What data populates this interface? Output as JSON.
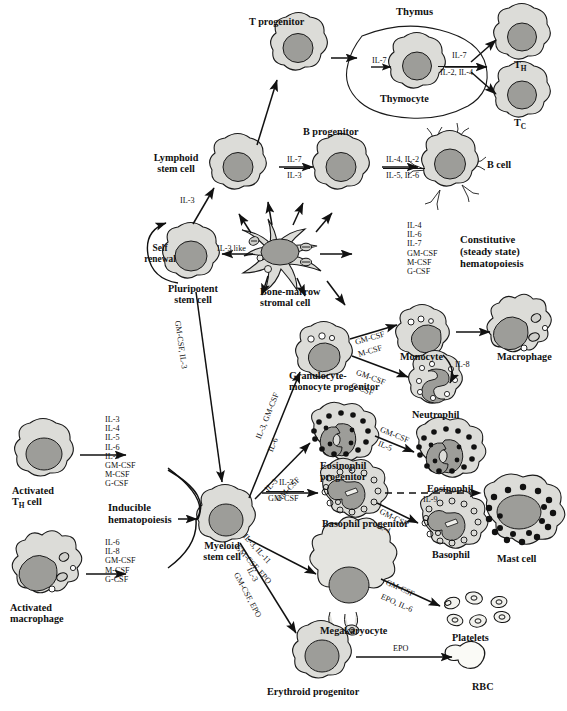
{
  "diagram": {
    "colors": {
      "cytoplasm": "#dcdcd8",
      "nucleus": "#9d9d99",
      "outline": "#1a1a1a",
      "granule": "#111111",
      "background": "#ffffff"
    }
  },
  "cells": {
    "t_progenitor": "T progenitor",
    "thymus": "Thymus",
    "thymocyte": "Thymocyte",
    "th": "T",
    "th_sub": "H",
    "tc": "T",
    "tc_sub": "C",
    "lymphoid_stem": "Lymphoid\nstem cell",
    "b_progenitor": "B progenitor",
    "b_cell": "B cell",
    "self_renewal": "Self\nrenewal",
    "pluripotent": "Pluripotent\nstem cell",
    "stromal": "Bone-marrow\nstromal cell",
    "constitutive": "Constitutive\n(steady state)\nhematopoiesis",
    "gm_progenitor": "Granulocyte-\nmonocyte progenitor",
    "monocyte": "Monocyte",
    "macrophage": "Macrophage",
    "neutrophil": "Neutrophil",
    "eosinophil_progenitor": "Eosinophil\nprogenitor",
    "eosinophil": "Eosinophil",
    "basophil_progenitor": "Basophil progenitor",
    "basophil": "Basophil",
    "mast_cell": "Mast cell",
    "megakaryocyte": "Megakaryocyte",
    "platelets": "Platelets",
    "erythroid_progenitor": "Erythroid progenitor",
    "rbc": "RBC",
    "myeloid_stem": "Myeloid\nstem cell",
    "activated_th": "Activated\nT",
    "activated_th_sub": "H",
    "activated_th_tail": " cell",
    "activated_macrophage": "Activated\nmacrophage",
    "inducible": "Inducible\nhematopoiesis"
  },
  "cytokines": {
    "to_lymphoid": "IL-3",
    "il3_like": "IL-3 like",
    "t_thymocyte": "IL-7",
    "thymocyte_out_top": "IL-7",
    "thymocyte_out_bottom": "IL-2, IL-4",
    "lymph_to_bprog_top": "IL-7",
    "lymph_to_bprog_bottom": "IL-3",
    "bprog_to_bcell_top": "IL-4, IL-2",
    "bprog_to_bcell_bottom": "IL-5, IL-6",
    "stromal_panel": [
      "IL-4",
      "IL-6",
      "IL-7",
      "GM-CSF",
      "M-CSF",
      "G-CSF"
    ],
    "pluri_to_myeloid": "GM-CSF, IL-3",
    "myeloid_to_gm_top": "IL-3, GM-CSF",
    "myeloid_to_gm_bottom": "IL-6",
    "gm_to_monocyte_top": "GM-CSF",
    "gm_to_monocyte_bottom": "M-CSF",
    "gm_to_neutrophil_top": "GM-CSF",
    "gm_to_neutrophil_bottom": "G-CSF",
    "monocyte_to_neutrophil": "IL-8",
    "myeloid_to_eos_top": "IL-3",
    "myeloid_to_eos_bottom": "GM-CSF",
    "eos_prog_to_eos_top": "GM-CSF",
    "eos_prog_to_eos_bottom": "IL-5",
    "myeloid_to_baso_top": "IL-3",
    "myeloid_to_baso_bottom": "GM-CSF",
    "baso_prog_to_baso_top": "GM-CSF",
    "baso_prog_to_baso_bottom": "IL-4",
    "baso_to_mast": "IL-9",
    "myeloid_to_mega_top": "IL-3, IL-11",
    "myeloid_to_mega_bottom": "GM-CSF, EPO",
    "myeloid_to_ery_top": "IL-3",
    "myeloid_to_ery_bottom": "GM-CSF, EPO",
    "mega_to_platelets_top": "GM-CSF",
    "mega_to_platelets_bottom": "EPO, IL-6",
    "ery_to_rbc": "EPO",
    "activated_th_panel": [
      "IL-3",
      "IL-4",
      "IL-5",
      "IL-6",
      "IL-9",
      "GM-CSF",
      "M-CSF",
      "G-CSF"
    ],
    "activated_mac_panel": [
      "IL-6",
      "IL-8",
      "GM-CSF",
      "M-CSF",
      "G-CSF"
    ]
  }
}
